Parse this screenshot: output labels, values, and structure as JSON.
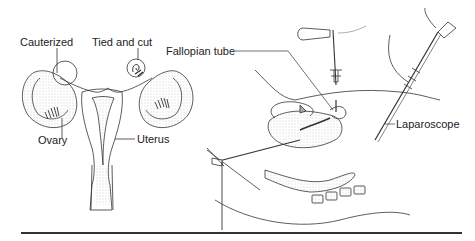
{
  "figure": {
    "type": "medical-illustration",
    "left_panel": {
      "labels": {
        "cauterized": "Cauterized",
        "tied_and_cut": "Tied and cut",
        "ovary": "Ovary",
        "uterus": "Uterus"
      }
    },
    "right_panel": {
      "labels": {
        "fallopian_tube": "Fallopian tube",
        "laparoscope": "Laparoscope"
      }
    },
    "colors": {
      "ink": "#222222",
      "stipple": "#aaaaaa",
      "rule": "#333333",
      "background": "#ffffff"
    }
  }
}
